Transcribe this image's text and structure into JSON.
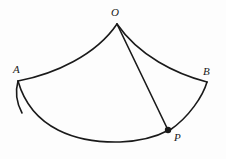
{
  "figure": {
    "kind": "geometry-diagram",
    "background_color": "#fdfdfd",
    "stroke_color": "#1a1a1a",
    "stroke_width": 1.6,
    "canvas": {
      "width": 226,
      "height": 159
    },
    "labels": {
      "apex": "O",
      "left_corner": "A",
      "right_corner": "B",
      "arc_point": "P"
    },
    "points": {
      "O": {
        "x": 117,
        "y": 24
      },
      "A": {
        "x": 18,
        "y": 84
      },
      "B": {
        "x": 207,
        "y": 85
      },
      "P": {
        "x": 168,
        "y": 130
      }
    },
    "marked_point": {
      "name": "P",
      "x": 168,
      "y": 130,
      "radius": 3.2,
      "filled": true
    },
    "paths": {
      "arc_O_to_A": "M 117 24 C 96 55, 55 74, 18 81",
      "arc_O_to_B": "M 117 24 C 139 56, 176 74, 207 82",
      "edge_A_to_arc": "M 18 81 C 15 92, 16 102, 22 113",
      "edge_B_to_P": "M 207 82 C 203 96, 189 117, 170 130",
      "arc_A_to_P": "M 18 81 C 32 130, 78 143, 120 142 C 142 141, 158 136, 169 130",
      "segment_O_to_P": "M 117 24 L 168 130"
    }
  }
}
